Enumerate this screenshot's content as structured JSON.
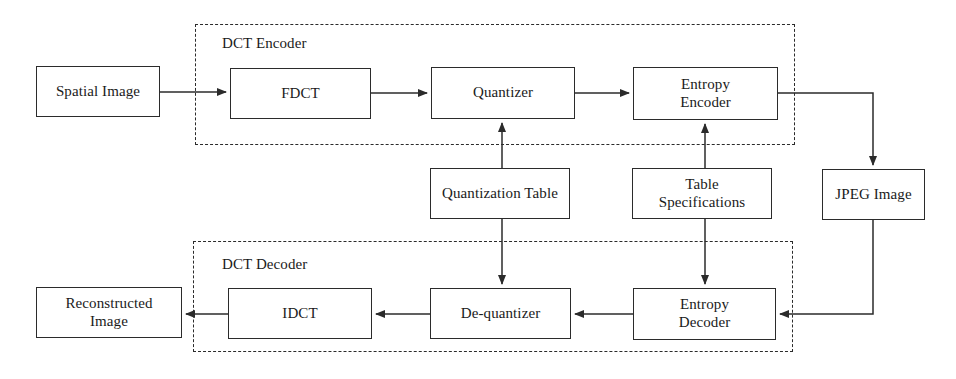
{
  "diagram": {
    "type": "block-flow-diagram",
    "colors": {
      "stroke": "#2b2b2b",
      "text": "#1a1a1a",
      "background": "#ffffff"
    },
    "groups": [
      {
        "id": "dct-encoder",
        "label": "DCT Encoder",
        "x": 195,
        "y": 24,
        "width": 600,
        "height": 121,
        "label_x": 222,
        "label_y": 35
      },
      {
        "id": "dct-decoder",
        "label": "DCT Decoder",
        "x": 193,
        "y": 241,
        "width": 600,
        "height": 111,
        "label_x": 222,
        "label_y": 256
      }
    ],
    "nodes": [
      {
        "id": "spatial-image",
        "label": "Spatial Image",
        "lines": [
          "Spatial Image"
        ],
        "x": 36,
        "y": 66,
        "width": 124,
        "height": 51
      },
      {
        "id": "fdct",
        "label": "FDCT",
        "lines": [
          "FDCT"
        ],
        "x": 230,
        "y": 68,
        "width": 141,
        "height": 51
      },
      {
        "id": "quantizer",
        "label": "Quantizer",
        "lines": [
          "Quantizer"
        ],
        "x": 431,
        "y": 67,
        "width": 144,
        "height": 52
      },
      {
        "id": "entropy-encoder",
        "label": "Entropy Encoder",
        "lines": [
          "Entropy",
          "Encoder"
        ],
        "x": 633,
        "y": 67,
        "width": 145,
        "height": 53
      },
      {
        "id": "quantization-table",
        "label": "Quantization Table",
        "lines": [
          "Quantization Table"
        ],
        "x": 430,
        "y": 168,
        "width": 140,
        "height": 51
      },
      {
        "id": "table-specifications",
        "label": "Table Specifications",
        "lines": [
          "Table",
          "Specifications"
        ],
        "x": 632,
        "y": 168,
        "width": 140,
        "height": 51
      },
      {
        "id": "jpeg-image",
        "label": "JPEG Image",
        "lines": [
          "JPEG Image"
        ],
        "x": 822,
        "y": 169,
        "width": 103,
        "height": 51
      },
      {
        "id": "reconstructed-image",
        "label": "Reconstructed Image",
        "lines": [
          "Reconstructed",
          "Image"
        ],
        "x": 36,
        "y": 287,
        "width": 146,
        "height": 51
      },
      {
        "id": "idct",
        "label": "IDCT",
        "lines": [
          "IDCT"
        ],
        "x": 228,
        "y": 288,
        "width": 144,
        "height": 51
      },
      {
        "id": "de-quantizer",
        "label": "De-quantizer",
        "lines": [
          "De-quantizer"
        ],
        "x": 430,
        "y": 288,
        "width": 141,
        "height": 51
      },
      {
        "id": "entropy-decoder",
        "label": "Entropy Decoder",
        "lines": [
          "Entropy",
          "Decoder"
        ],
        "x": 633,
        "y": 288,
        "width": 143,
        "height": 52
      }
    ],
    "connections": [
      {
        "id": "spatial-to-fdct",
        "from": "spatial-image",
        "to": "fdct",
        "direction": "right"
      },
      {
        "id": "fdct-to-quantizer",
        "from": "fdct",
        "to": "quantizer",
        "direction": "right"
      },
      {
        "id": "quantizer-to-entropy-encoder",
        "from": "quantizer",
        "to": "entropy-encoder",
        "direction": "right"
      },
      {
        "id": "entropy-encoder-to-jpeg",
        "from": "entropy-encoder",
        "to": "jpeg-image",
        "direction": "down"
      },
      {
        "id": "quantization-table-to-quantizer",
        "from": "quantization-table",
        "to": "quantizer",
        "direction": "up"
      },
      {
        "id": "table-spec-to-entropy-encoder",
        "from": "table-specifications",
        "to": "entropy-encoder",
        "direction": "up"
      },
      {
        "id": "quantization-table-to-de-quantizer",
        "from": "quantization-table",
        "to": "de-quantizer",
        "direction": "down"
      },
      {
        "id": "table-spec-to-entropy-decoder",
        "from": "table-specifications",
        "to": "entropy-decoder",
        "direction": "down"
      },
      {
        "id": "jpeg-to-entropy-decoder",
        "from": "jpeg-image",
        "to": "entropy-decoder",
        "direction": "left"
      },
      {
        "id": "entropy-decoder-to-de-quantizer",
        "from": "entropy-decoder",
        "to": "de-quantizer",
        "direction": "left"
      },
      {
        "id": "de-quantizer-to-idct",
        "from": "de-quantizer",
        "to": "idct",
        "direction": "left"
      },
      {
        "id": "idct-to-reconstructed",
        "from": "idct",
        "to": "reconstructed-image",
        "direction": "left"
      }
    ]
  }
}
